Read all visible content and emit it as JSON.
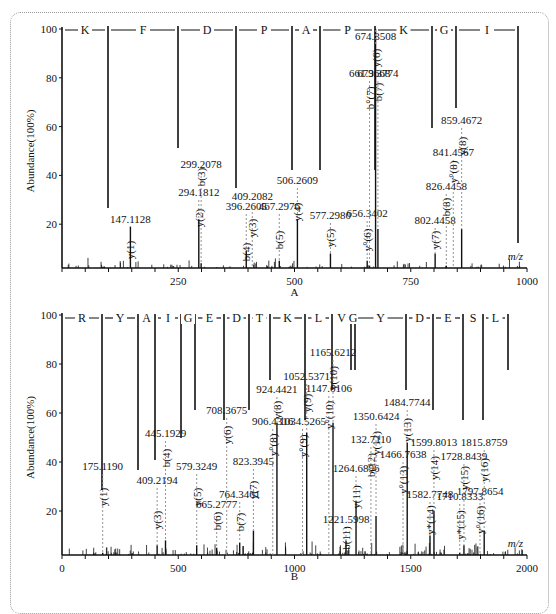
{
  "chart_data": [
    {
      "panel": "A",
      "type": "bar",
      "title": "",
      "xlabel": "m/z",
      "ylabel": "Abundance(100%)",
      "xlim": [
        0,
        1000
      ],
      "ylim": [
        0,
        100
      ],
      "xticks": [
        "250",
        "500",
        "750",
        "1000"
      ],
      "yticks": [
        "20",
        "40",
        "60",
        "80",
        "100"
      ],
      "sequence": [
        "K",
        "F",
        "D",
        "P",
        "A",
        "P",
        "K",
        "G",
        "I"
      ],
      "peaks": [
        {
          "mz": 147.1128,
          "label": "147.1128",
          "ion": "y(1)",
          "abundance": 19
        },
        {
          "mz": 294.1812,
          "label": "294.1812",
          "ion": "y(2)",
          "abundance": 22
        },
        {
          "mz": 299.2078,
          "label": "299.2078",
          "ion": "b(3)",
          "abundance": 4
        },
        {
          "mz": 396.2605,
          "label": "396.2605",
          "ion": "b(4)",
          "abundance": 9
        },
        {
          "mz": 409.2082,
          "label": "409.2082",
          "ion": "y(3)",
          "abundance": 2
        },
        {
          "mz": 467.2976,
          "label": "467.2976",
          "ion": "b(5)",
          "abundance": 5
        },
        {
          "mz": 506.2609,
          "label": "506.2609",
          "ion": "y(4)",
          "abundance": 22
        },
        {
          "mz": 577.298,
          "label": "577.2980",
          "ion": "y(5)",
          "abundance": 8
        },
        {
          "mz": 656.3402,
          "label": "656.3402",
          "ion": "y°(6)",
          "abundance": 5
        },
        {
          "mz": 661.3668,
          "label": "661.3668",
          "ion": "b°(7)",
          "abundance": 3
        },
        {
          "mz": 674.3508,
          "label": "674.3508",
          "ion": "y(6)",
          "abundance": 100
        },
        {
          "mz": 679.3774,
          "label": "679.3774",
          "ion": "b(7)",
          "abundance": 18
        },
        {
          "mz": 802.4458,
          "label": "802.4458",
          "ion": "y(7)",
          "abundance": 8
        },
        {
          "mz": 826.4458,
          "label": "826.4458",
          "ion": "b(8)",
          "abundance": 3
        },
        {
          "mz": 841.4567,
          "label": "841.4567",
          "ion": "y°(8)",
          "abundance": 2
        },
        {
          "mz": 859.4672,
          "label": "859.4672",
          "ion": "y(8)",
          "abundance": 18
        }
      ]
    },
    {
      "panel": "B",
      "type": "bar",
      "title": "",
      "xlabel": "m/z",
      "ylabel": "Abundance(100%)",
      "xlim": [
        0,
        2000
      ],
      "ylim": [
        0,
        100
      ],
      "xticks": [
        "0",
        "500",
        "1000",
        "1500",
        "2000"
      ],
      "yticks": [
        "20",
        "40",
        "60",
        "80",
        "100"
      ],
      "sequence": [
        "R",
        "Y",
        "A",
        "I",
        "G",
        "E",
        "D",
        "T",
        "K",
        "L",
        "V",
        "G",
        "Y",
        "D",
        "E",
        "S",
        "L"
      ],
      "peaks": [
        {
          "mz": 175.119,
          "label": "175.1190",
          "ion": "y(1)",
          "abundance": 3
        },
        {
          "mz": 409.2194,
          "label": "409.2194",
          "ion": "y(3)",
          "abundance": 6
        },
        {
          "mz": 445.1929,
          "label": "445.1929",
          "ion": "b(4)",
          "abundance": 8
        },
        {
          "mz": 579.3249,
          "label": "579.3249",
          "ion": "y(5)",
          "abundance": 6
        },
        {
          "mz": 665.2777,
          "label": "665.2777",
          "ion": "b(6)",
          "abundance": 5
        },
        {
          "mz": 708.3675,
          "label": "708.3675",
          "ion": "y(6)",
          "abundance": 2
        },
        {
          "mz": 764.3461,
          "label": "764.3461",
          "ion": "b(7)",
          "abundance": 7
        },
        {
          "mz": 823.3945,
          "label": "823.3945",
          "ion": "y(7)",
          "abundance": 12
        },
        {
          "mz": 906.4316,
          "label": "906.4316",
          "ion": "y°(8)",
          "abundance": 2
        },
        {
          "mz": 924.4421,
          "label": "924.4421",
          "ion": "y(8)",
          "abundance": 56
        },
        {
          "mz": 1034.5265,
          "label": "1034.5265",
          "ion": "y°(9)",
          "abundance": 2
        },
        {
          "mz": 1052.5371,
          "label": "1052.5371",
          "ion": "y(9)",
          "abundance": 52
        },
        {
          "mz": 1147.6106,
          "label": "1147.6106",
          "ion": "y°(10)",
          "abundance": 2
        },
        {
          "mz": 1165.6212,
          "label": "1165.6212",
          "ion": "y(10)",
          "abundance": 56
        },
        {
          "mz": 1221.5998,
          "label": "1221.5998",
          "ion": "b(11)",
          "abundance": 8
        },
        {
          "mz": 1264.6896,
          "label": "1264.6896",
          "ion": "y(11)",
          "abundance": 24
        },
        {
          "mz": 1328.711,
          "label": "132.7110",
          "ion": "b(12)",
          "abundance": 2
        },
        {
          "mz": 1350.6424,
          "label": "1350.6424",
          "ion": "y(12)",
          "abundance": 18
        },
        {
          "mz": 1466.7638,
          "label": "1466.7638",
          "ion": "y°(13)",
          "abundance": 2
        },
        {
          "mz": 1484.7744,
          "label": "1484.7744",
          "ion": "y(13)",
          "abundance": 48
        },
        {
          "mz": 1582.7748,
          "label": "1582.7748",
          "ion": "y*(14)",
          "abundance": 10
        },
        {
          "mz": 1599.8013,
          "label": "1599.8013",
          "ion": "y(14)",
          "abundance": 20
        },
        {
          "mz": 1710.8333,
          "label": "1710.8333",
          "ion": "y*(15)",
          "abundance": 3
        },
        {
          "mz": 1728.8439,
          "label": "1728.8439",
          "ion": "y(15)",
          "abundance": 6
        },
        {
          "mz": 1797.8654,
          "label": "1797.8654",
          "ion": "y°(16)",
          "abundance": 2
        },
        {
          "mz": 1815.8759,
          "label": "1815.8759",
          "ion": "y(16)",
          "abundance": 12
        }
      ]
    }
  ],
  "panels": {
    "a": {
      "caption": "A",
      "ylabel": "Abundance(100%)",
      "xlabel": "m/z"
    },
    "b": {
      "caption": "B",
      "ylabel": "Abundance(100%)",
      "xlabel": "m/z"
    }
  }
}
